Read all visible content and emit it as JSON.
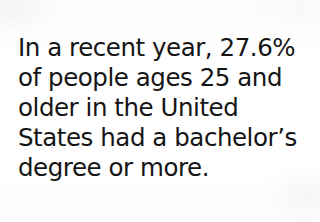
{
  "slide": {
    "background_color": "#ffffff",
    "text_color": "#151515",
    "statement": {
      "full_text": "In a recent year, 27.6% of people ages 25 and older in the United States had a bachelor's degree or more.",
      "lines": [
        "In a recent year, 27.6%",
        "of people ages 25 and",
        "older in the United",
        "States had a bachelor’s",
        "degree or more."
      ],
      "statistic_value": "27.6%",
      "age_reference": "25",
      "region": "United States",
      "credential": "bachelor’s degree or more"
    }
  }
}
